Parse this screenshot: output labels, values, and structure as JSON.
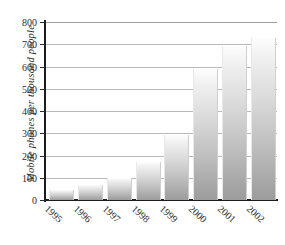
{
  "chart_data": {
    "type": "bar",
    "title": "",
    "xlabel": "",
    "ylabel": "Mobile phones per thousand people",
    "categories": [
      "1995",
      "1996",
      "1997",
      "1998",
      "1999",
      "2000",
      "2001",
      "2002"
    ],
    "values": [
      47,
      68,
      100,
      170,
      292,
      590,
      690,
      730
    ],
    "ylim": [
      0,
      800
    ],
    "ytick_labels": [
      "0",
      "100",
      "200",
      "300",
      "400",
      "500",
      "600",
      "700",
      "800"
    ],
    "ytick_values": [
      0,
      100,
      200,
      300,
      400,
      500,
      600,
      700,
      800
    ],
    "grid": true,
    "legend": "none",
    "bar_fill": "#c4c4c4",
    "axis_color": "#1c1c1c",
    "grid_color": "#b9b9b9",
    "background": "#ffffff"
  }
}
